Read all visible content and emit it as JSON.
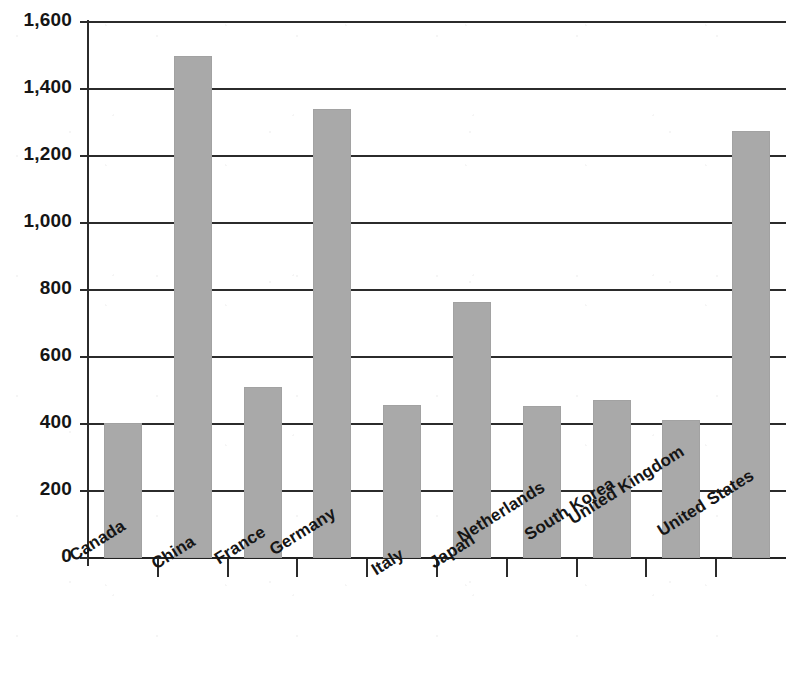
{
  "chart_data": {
    "type": "bar",
    "title": "",
    "subtitle": "",
    "xlabel": "",
    "ylabel": "",
    "categories": [
      "Canada",
      "China",
      "France",
      "Germany",
      "Italy",
      "Japan",
      "Netherlands",
      "South Korea",
      "United Kingdom",
      "United States"
    ],
    "values": [
      403,
      1500,
      510,
      1340,
      457,
      765,
      455,
      472,
      412,
      1275
    ],
    "series": [
      {
        "name": "",
        "values": [
          403,
          1500,
          510,
          1340,
          457,
          765,
          455,
          472,
          412,
          1275
        ]
      }
    ],
    "ylim": [
      0,
      1600
    ],
    "ytick_values": [
      0,
      200,
      400,
      600,
      800,
      1000,
      1200,
      1400,
      1600
    ],
    "ytick_labels": [
      "0",
      "200",
      "400",
      "600",
      "800",
      "1,000",
      "1,200",
      "1,400",
      "1,600"
    ],
    "grid": "horizontal",
    "legend": "none",
    "bar_color": "#a9a9a9",
    "axis_color": "#2b2b2b",
    "background": "#ffffff",
    "xtick_label_rotation": -32,
    "annotations": []
  }
}
